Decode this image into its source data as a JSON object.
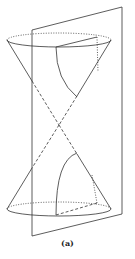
{
  "figure": {
    "caption": "(a)",
    "colors": {
      "stroke": "#333333",
      "background": "#ffffff"
    }
  }
}
